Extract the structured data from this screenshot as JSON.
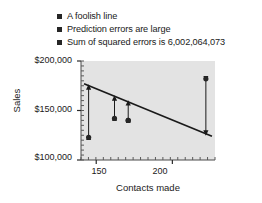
{
  "legend": {
    "items": [
      {
        "label": "A foolish line",
        "marker": "square-marker"
      },
      {
        "label": "Prediction errors are large",
        "marker": "square-marker"
      },
      {
        "label": "Sum of squared errors is 6,002,064,073",
        "marker": "square-marker"
      }
    ]
  },
  "chart_data": {
    "type": "scatter",
    "title": "",
    "xlabel": "Contacts made",
    "ylabel": "Sales",
    "xlim": [
      140,
      228
    ],
    "ylim": [
      100000,
      200000
    ],
    "grid": false,
    "legend_position": "top",
    "xticks": [
      150,
      200
    ],
    "xtick_labels": [
      "150",
      "200"
    ],
    "yticks": [
      100000,
      150000,
      200000
    ],
    "ytick_labels": [
      "$100,000",
      "$150,000",
      "$200,000"
    ],
    "x_minor_tick_count": 9,
    "y_minor_tick_count": 10,
    "points": [
      {
        "x": 145,
        "y": 123000
      },
      {
        "x": 162,
        "y": 142000
      },
      {
        "x": 171,
        "y": 140000
      },
      {
        "x": 171,
        "y": 140000
      },
      {
        "x": 222,
        "y": 182000
      }
    ],
    "series": [
      {
        "name": "A foolish line",
        "type": "line",
        "x": [
          142,
          226
        ],
        "values": [
          177000,
          124000
        ],
        "color": "#1a1a1a"
      }
    ],
    "residual_arrows": [
      {
        "x": 145,
        "y_point": 123000,
        "y_line": 174000
      },
      {
        "x": 162,
        "y_point": 142000,
        "y_line": 163000
      },
      {
        "x": 171,
        "y_point": 140000,
        "y_line": 158000
      },
      {
        "x": 222,
        "y_point": 182000,
        "y_line": 127000
      }
    ],
    "plot_background": "#e3e3e3",
    "marker_color": "#262626",
    "sum_of_squared_errors": "6,002,064,073"
  }
}
